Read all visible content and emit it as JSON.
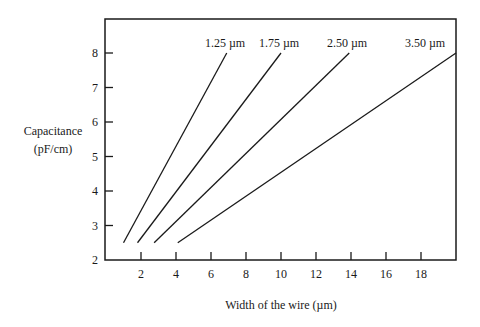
{
  "chart_data": {
    "type": "line",
    "title": "",
    "xlabel": "Width of the wire (µm)",
    "ylabel_lines": [
      "Capacitance",
      "(pF/cm)"
    ],
    "xlim": [
      0,
      20
    ],
    "ylim": [
      2,
      9
    ],
    "xticks": [
      2,
      4,
      6,
      8,
      10,
      12,
      14,
      16,
      18
    ],
    "yticks": [
      2,
      3,
      4,
      5,
      6,
      7,
      8
    ],
    "grid": false,
    "legend": "inline labels above line ends",
    "series": [
      {
        "name": "1.25 µm",
        "x": [
          1.0,
          6.9
        ],
        "y": [
          2.5,
          8.0
        ]
      },
      {
        "name": "1.75 µm",
        "x": [
          1.8,
          10.0
        ],
        "y": [
          2.5,
          8.0
        ]
      },
      {
        "name": "2.50 µm",
        "x": [
          2.75,
          13.9
        ],
        "y": [
          2.5,
          8.0
        ]
      },
      {
        "name": "3.50 µm",
        "x": [
          4.1,
          20.0
        ],
        "y": [
          2.5,
          8.0
        ]
      }
    ]
  }
}
